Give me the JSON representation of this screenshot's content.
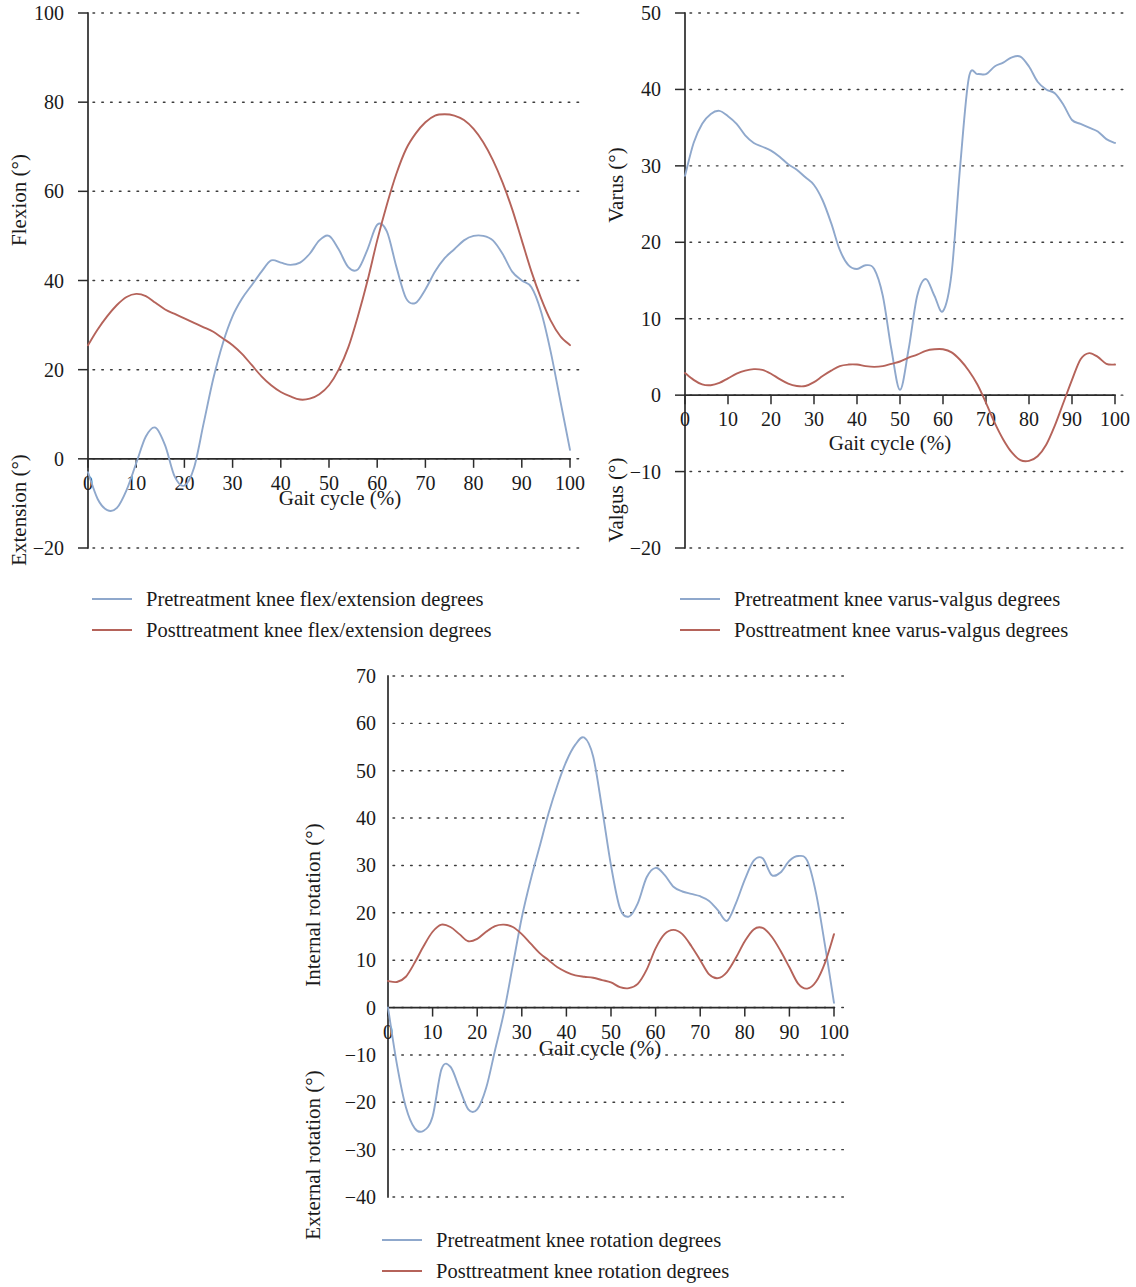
{
  "figure": {
    "kind": "three-panel gait kinematics figure",
    "colors": {
      "pretreatment": "#8fa8cc",
      "posttreatment": "#b5635a",
      "axis": "#2b2b2b",
      "grid": "#3c3c3c",
      "background": "#ffffff"
    }
  },
  "chart_data": [
    {
      "id": "flexion",
      "type": "line",
      "title": "",
      "xlabel": "Gait cycle (%)",
      "ylabel_positive": "Flexion (°)",
      "ylabel_negative": "Extension (°)",
      "xlim": [
        0,
        100
      ],
      "ylim": [
        -20,
        100
      ],
      "xticks": [
        0,
        10,
        20,
        30,
        40,
        50,
        60,
        70,
        80,
        90,
        100
      ],
      "xtick_labels": [
        "0",
        "10",
        "20",
        "30",
        "40",
        "50",
        "60",
        "70",
        "80",
        "90",
        "100"
      ],
      "yticks": [
        -20,
        0,
        20,
        40,
        60,
        80,
        100
      ],
      "ytick_labels": [
        "−20",
        "0",
        "20",
        "40",
        "60",
        "80",
        "100"
      ],
      "grid": "horizontal dotted",
      "legend_position": "below",
      "x": [
        0,
        2,
        4,
        6,
        8,
        10,
        12,
        14,
        16,
        18,
        20,
        22,
        24,
        26,
        28,
        30,
        32,
        34,
        36,
        38,
        40,
        42,
        44,
        46,
        48,
        50,
        52,
        54,
        56,
        58,
        60,
        62,
        64,
        66,
        68,
        70,
        72,
        74,
        76,
        78,
        80,
        82,
        84,
        86,
        88,
        90,
        92,
        94,
        96,
        98,
        100
      ],
      "series": [
        {
          "name": "Pretreatment knee flex/extension degrees",
          "color": "#8fa8cc",
          "values": [
            -3,
            -9,
            -11.5,
            -11,
            -7,
            -1,
            5,
            7,
            3,
            -4,
            -6,
            -2,
            8,
            18,
            26,
            32,
            36,
            39,
            42,
            44.5,
            44,
            43.5,
            44,
            46,
            49,
            50,
            47,
            43,
            42.5,
            47,
            52.5,
            51,
            43,
            36,
            35,
            38,
            42,
            45,
            47,
            49,
            50,
            50,
            49,
            46,
            42,
            40,
            38.5,
            33,
            24,
            13,
            2
          ]
        },
        {
          "name": "Posttreatment knee flex/extension degrees",
          "color": "#b5635a",
          "values": [
            25.5,
            29,
            32,
            34.5,
            36.3,
            37,
            36.5,
            35,
            33.5,
            32.5,
            31.5,
            30.5,
            29.5,
            28.5,
            27,
            25.5,
            23.5,
            21,
            18.5,
            16.5,
            15,
            14,
            13.3,
            13.5,
            14.5,
            16.5,
            20,
            25,
            32,
            40,
            49,
            57,
            64,
            69.5,
            73,
            75.5,
            77,
            77.3,
            77,
            76,
            74,
            71,
            67,
            62,
            56,
            49,
            42,
            36,
            31,
            27.5,
            25.5
          ]
        }
      ]
    },
    {
      "id": "varus-valgus",
      "type": "line",
      "title": "",
      "xlabel": "Gait cycle (%)",
      "ylabel_positive": "Varus (°)",
      "ylabel_negative": "Valgus (°)",
      "xlim": [
        0,
        100
      ],
      "ylim": [
        -20,
        50
      ],
      "xticks": [
        0,
        10,
        20,
        30,
        40,
        50,
        60,
        70,
        80,
        90,
        100
      ],
      "xtick_labels": [
        "0",
        "10",
        "20",
        "30",
        "40",
        "50",
        "60",
        "70",
        "80",
        "90",
        "100"
      ],
      "yticks": [
        -20,
        -10,
        0,
        10,
        20,
        30,
        40,
        50
      ],
      "ytick_labels": [
        "−20",
        "−10",
        "0",
        "10",
        "20",
        "30",
        "40",
        "50"
      ],
      "grid": "horizontal dotted",
      "legend_position": "below",
      "x": [
        0,
        2,
        4,
        6,
        8,
        10,
        12,
        14,
        16,
        18,
        20,
        22,
        24,
        26,
        28,
        30,
        32,
        34,
        36,
        38,
        40,
        42,
        44,
        46,
        48,
        50,
        52,
        54,
        56,
        58,
        60,
        62,
        64,
        66,
        68,
        70,
        72,
        74,
        76,
        78,
        80,
        82,
        84,
        86,
        88,
        90,
        92,
        94,
        96,
        98,
        100
      ],
      "series": [
        {
          "name": "Pretreatment knee varus-valgus degrees",
          "color": "#8fa8cc",
          "values": [
            28.7,
            33,
            35.5,
            36.8,
            37.2,
            36.5,
            35.5,
            34,
            33,
            32.5,
            32,
            31.2,
            30.2,
            29.5,
            28.5,
            27.5,
            25.5,
            22.5,
            19,
            17,
            16.5,
            17,
            16.5,
            13,
            6,
            0.7,
            6,
            13,
            15.2,
            13,
            11,
            16,
            30,
            41.5,
            42,
            42,
            43,
            43.5,
            44.2,
            44.3,
            43,
            41,
            40,
            39.5,
            38,
            36,
            35.5,
            35,
            34.5,
            33.5,
            33
          ]
        },
        {
          "name": "Posttreatment knee varus-valgus degrees",
          "color": "#b5635a",
          "values": [
            2.9,
            2,
            1.4,
            1.3,
            1.6,
            2.2,
            2.8,
            3.2,
            3.4,
            3.3,
            2.8,
            2.1,
            1.5,
            1.2,
            1.2,
            1.7,
            2.5,
            3.2,
            3.8,
            4,
            4,
            3.8,
            3.7,
            3.8,
            4.1,
            4.4,
            4.9,
            5.3,
            5.8,
            6,
            6,
            5.6,
            4.6,
            3.2,
            1.4,
            -1,
            -3.6,
            -5.8,
            -7.5,
            -8.5,
            -8.6,
            -8,
            -6.5,
            -4,
            -1,
            2,
            4.7,
            5.5,
            5,
            4.1,
            4
          ]
        }
      ]
    },
    {
      "id": "rotation",
      "type": "line",
      "title": "",
      "xlabel": "Gait cycle (%)",
      "ylabel_positive": "Internal rotation (°)",
      "ylabel_negative": "External rotation (°)",
      "xlim": [
        0,
        100
      ],
      "ylim": [
        -40,
        70
      ],
      "xticks": [
        0,
        10,
        20,
        30,
        40,
        50,
        60,
        70,
        80,
        90,
        100
      ],
      "xtick_labels": [
        "0",
        "10",
        "20",
        "30",
        "40",
        "50",
        "60",
        "70",
        "80",
        "90",
        "100"
      ],
      "yticks": [
        -40,
        -30,
        -20,
        -10,
        0,
        10,
        20,
        30,
        40,
        50,
        60,
        70
      ],
      "ytick_labels": [
        "−40",
        "−30",
        "−20",
        "−10",
        "0",
        "10",
        "20",
        "30",
        "40",
        "50",
        "60",
        "70"
      ],
      "grid": "horizontal dotted",
      "legend_position": "below",
      "x": [
        0,
        2,
        4,
        6,
        8,
        10,
        12,
        14,
        16,
        18,
        20,
        22,
        24,
        26,
        28,
        30,
        32,
        34,
        36,
        38,
        40,
        42,
        44,
        46,
        48,
        50,
        52,
        54,
        56,
        58,
        60,
        62,
        64,
        66,
        68,
        70,
        72,
        74,
        76,
        78,
        80,
        82,
        84,
        86,
        88,
        90,
        92,
        94,
        96,
        98,
        100
      ],
      "series": [
        {
          "name": "Pretreatment knee rotation degrees",
          "color": "#8fa8cc",
          "values": [
            0,
            -12,
            -21,
            -25.5,
            -26,
            -23,
            -13,
            -12.5,
            -17,
            -21.5,
            -21.5,
            -17,
            -9,
            -1,
            9,
            19,
            27,
            34,
            41,
            47,
            52,
            55.5,
            57,
            53,
            42,
            30,
            21,
            19.2,
            22,
            27.5,
            29.5,
            28,
            25.5,
            24.5,
            24,
            23.5,
            22.5,
            20.5,
            18.3,
            22,
            27,
            31,
            31.5,
            28,
            28.5,
            31,
            32,
            31,
            24,
            13,
            1
          ]
        },
        {
          "name": "Posttreatment knee rotation degrees",
          "color": "#b5635a",
          "values": [
            5.6,
            5.4,
            6.5,
            9.5,
            13,
            16,
            17.5,
            17,
            15.5,
            14,
            14.5,
            16,
            17.2,
            17.5,
            17,
            15.5,
            13.5,
            11.5,
            10,
            8.5,
            7.5,
            6.8,
            6.5,
            6.3,
            5.8,
            5.3,
            4.3,
            4.1,
            5,
            8,
            12.5,
            15.5,
            16.4,
            15.5,
            13,
            10,
            7,
            6.2,
            7.5,
            10.5,
            14,
            16.5,
            16.8,
            15,
            12,
            8.5,
            5,
            4,
            5.5,
            9.5,
            15.5
          ]
        }
      ]
    }
  ],
  "panels": {
    "flexion": {
      "legend": [
        {
          "label": "Pretreatment knee flex/extension degrees",
          "color": "#8fa8cc"
        },
        {
          "label": "Posttreatment knee flex/extension degrees",
          "color": "#b5635a"
        }
      ]
    },
    "varus": {
      "legend": [
        {
          "label": "Pretreatment knee varus-valgus degrees",
          "color": "#8fa8cc"
        },
        {
          "label": "Posttreatment knee varus-valgus degrees",
          "color": "#b5635a"
        }
      ]
    },
    "rotation": {
      "legend": [
        {
          "label": "Pretreatment knee rotation degrees",
          "color": "#8fa8cc"
        },
        {
          "label": "Posttreatment knee rotation degrees",
          "color": "#b5635a"
        }
      ]
    }
  }
}
